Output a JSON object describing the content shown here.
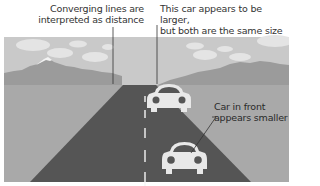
{
  "diagram": {
    "type": "illustration",
    "annotations": {
      "converging_lines": "Converging lines are interpreted as distance",
      "larger_car": "This car appears to be larger, but both are the same size",
      "front_car": "Car in front appears smaller"
    },
    "annotation_lines": {
      "converging_lines": [
        "Converging lines are",
        "interpreted as distance"
      ],
      "larger_car": [
        "This car appears to be larger,",
        "but both are the same size"
      ],
      "front_car": [
        "Car in front",
        "appears smaller"
      ]
    },
    "elements": [
      "sky-with-clouds",
      "mountains",
      "road-converging",
      "center-dashed-line",
      "far-car",
      "near-car"
    ],
    "colors": {
      "sky": "#c9c9c9",
      "clouds": "#e6e6e6",
      "mountain": "#9a9a9a",
      "mountain_snow": "#f2f2f2",
      "ground": "#a9a9a9",
      "road": "#555555",
      "car": "#e8e8e8",
      "leader_line": "#333333",
      "text": "#333333"
    }
  }
}
